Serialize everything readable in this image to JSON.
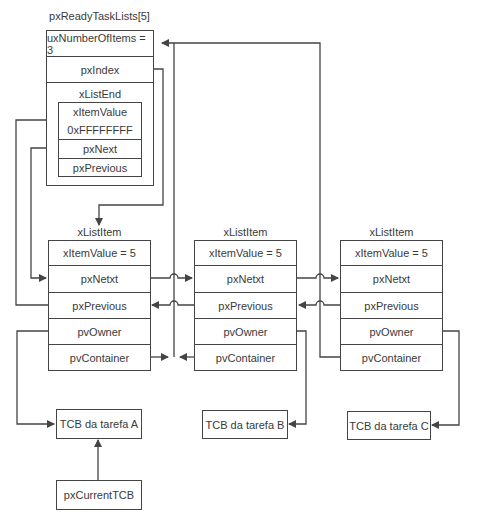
{
  "ready_list": {
    "title": "pxReadyTaskLists[5]",
    "ux_number_of_items": "uxNumberOfItems = 3",
    "px_index": "pxIndex",
    "list_end": {
      "title": "xListEnd",
      "item_value_label": "xItemValue",
      "item_value": "0xFFFFFFFF",
      "px_next": "pxNext",
      "px_previous": "pxPrevious"
    }
  },
  "list_items": [
    {
      "title": "xListItem",
      "item_value": "xItemValue = 5",
      "px_next": "pxNetxt",
      "px_previous": "pxPrevious",
      "pv_owner": "pvOwner",
      "pv_container": "pvContainer"
    },
    {
      "title": "xListItem",
      "item_value": "xItemValue = 5",
      "px_next": "pxNetxt",
      "px_previous": "pxPrevious",
      "pv_owner": "pvOwner",
      "pv_container": "pvContainer"
    },
    {
      "title": "xListItem",
      "item_value": "xItemValue = 5",
      "px_next": "pxNetxt",
      "px_previous": "pxPrevious",
      "pv_owner": "pvOwner",
      "pv_container": "pvContainer"
    }
  ],
  "tcbs": [
    {
      "label": "TCB da tarefa A"
    },
    {
      "label": "TCB da tarefa B"
    },
    {
      "label": "TCB da tarefa C"
    }
  ],
  "current_tcb": "pxCurrentTCB",
  "colors": {
    "line": "#444444",
    "text": "#3a3a3a",
    "background": "#ffffff"
  }
}
